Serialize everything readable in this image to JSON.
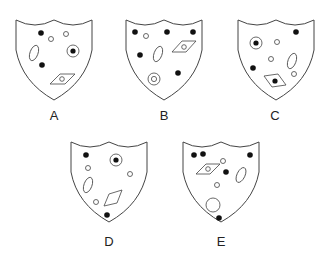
{
  "colors": {
    "stroke": "#444444",
    "fill_dark": "#111111",
    "background": "#ffffff"
  },
  "shields": [
    {
      "label": "A",
      "elements": [
        "filled-dot",
        "small-circle",
        "small-circle",
        "oval",
        "ringed-dot",
        "filled-dot",
        "diamond-with-circle"
      ]
    },
    {
      "label": "B",
      "elements": [
        "filled-dot",
        "small-circle",
        "filled-dot",
        "filled-dot",
        "diamond-with-circle",
        "filled-dot",
        "oval",
        "double-circle",
        "filled-dot"
      ]
    },
    {
      "label": "C",
      "elements": [
        "filled-dot",
        "ringed-dot",
        "small-circle",
        "small-circle",
        "oval",
        "filled-dot",
        "small-circle",
        "diamond-with-dot"
      ]
    },
    {
      "label": "D",
      "elements": [
        "filled-dot",
        "ringed-dot",
        "small-circle",
        "small-circle",
        "oval",
        "small-circle",
        "diamond",
        "filled-dot"
      ]
    },
    {
      "label": "E",
      "elements": [
        "filled-dot",
        "filled-dot",
        "small-circle",
        "filled-dot",
        "diamond-with-circle",
        "filled-dot",
        "oval",
        "small-circle",
        "large-circle",
        "filled-dot"
      ]
    }
  ]
}
